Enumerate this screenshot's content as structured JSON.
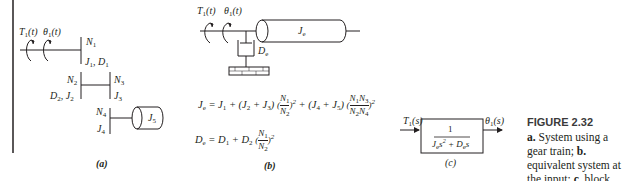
{
  "figure": {
    "number": "FIGURE 2.32",
    "caption_lines": [
      {
        "bold": "a.",
        "text": " System using a gear"
      },
      {
        "bold": "",
        "text": "train; "
      },
      {
        "bold": "b.",
        "text": " equivalent"
      },
      {
        "bold": "",
        "text": "system at the input;"
      },
      {
        "bold": "c.",
        "text": " block diagram"
      }
    ],
    "caption_full": "a. System using a gear train; b. equivalent system at the input; c. block diagram"
  },
  "panel_a": {
    "label": "(a)",
    "torque": "T1(t)",
    "angle": "θ1(t)",
    "gear_labels": {
      "N1": "N1",
      "J1D1": "J1, D1",
      "N2": "N2",
      "D2J2": "D2, J2",
      "N3": "N3",
      "J3": "J3",
      "N4": "N4",
      "J4": "J4",
      "J5": "J5"
    }
  },
  "panel_b": {
    "label": "(b)",
    "torque": "T1(t)",
    "angle": "θ1(t)",
    "inertia": "Je",
    "damper": "De",
    "equation_Je": "Je = J1 + (J2 + J3)(N1/N2)^2 + (J4 + J5)(N1N3/N2N4)^2",
    "equation_De": "De = D1 + D2(N1/N2)^2"
  },
  "panel_c": {
    "label": "(c)",
    "input": "T1(s)",
    "output": "θ1(s)",
    "tf_numerator": "1",
    "tf_denominator": "Je s^2 + De s"
  }
}
